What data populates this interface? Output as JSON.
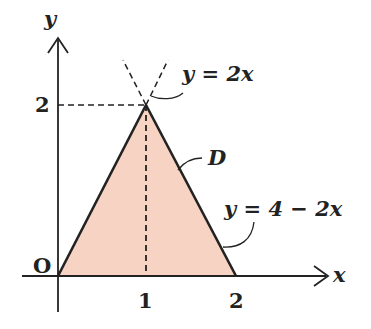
{
  "diagram": {
    "axes": {
      "x_label": "x",
      "y_label": "y",
      "origin_label": "O"
    },
    "ticks": {
      "x": [
        "1",
        "2"
      ],
      "y": [
        "2"
      ]
    },
    "region_label": "D",
    "curves": [
      {
        "label": "y = 2x"
      },
      {
        "label": "y = 4 − 2x"
      }
    ],
    "vertices": [
      [
        0,
        0
      ],
      [
        1,
        2
      ],
      [
        2,
        0
      ]
    ],
    "colors": {
      "fill": "#f7d3c3",
      "stroke": "#222222"
    }
  }
}
